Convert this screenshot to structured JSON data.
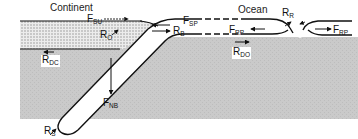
{
  "diagram": {
    "type": "plate-tectonics-forces",
    "regions": {
      "continent": "Continent",
      "ocean": "Ocean"
    },
    "labels": [
      {
        "id": "F_SU",
        "base": "F",
        "sub": "SU"
      },
      {
        "id": "R_O",
        "base": "R",
        "sub": "O"
      },
      {
        "id": "R_DC",
        "base": "R",
        "sub": "DC"
      },
      {
        "id": "F_SP",
        "base": "F",
        "sub": "SP"
      },
      {
        "id": "R_B",
        "base": "R",
        "sub": "B"
      },
      {
        "id": "F_RP_left",
        "base": "F",
        "sub": "RP"
      },
      {
        "id": "R_DO",
        "base": "R",
        "sub": "DO"
      },
      {
        "id": "R_R",
        "base": "R",
        "sub": "R"
      },
      {
        "id": "F_RP_right",
        "base": "F",
        "sub": "RP"
      },
      {
        "id": "F_NB",
        "base": "F",
        "sub": "NB"
      },
      {
        "id": "R_S",
        "base": "R",
        "sub": "S"
      }
    ],
    "colors": {
      "mantle": "#c8c8c8",
      "continent_fill": "#e2e2e2",
      "plate": "#ffffff",
      "stroke": "#111111"
    }
  }
}
